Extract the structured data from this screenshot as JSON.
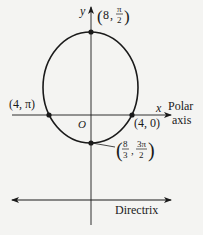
{
  "diagram": {
    "type": "polar-conic-ellipse",
    "axes": {
      "x_label": "x",
      "y_label": "y",
      "origin_label": "O",
      "polar_axis_label_line1": "Polar",
      "polar_axis_label_line2": "axis"
    },
    "points": [
      {
        "name": "top",
        "label_r": "8",
        "label_theta_num": "π",
        "label_theta_den": "2"
      },
      {
        "name": "left",
        "label": "(4, π)"
      },
      {
        "name": "right",
        "label": "(4, 0)"
      },
      {
        "name": "bottom",
        "label_r_num": "8",
        "label_r_den": "3",
        "label_theta_num": "3π",
        "label_theta_den": "2"
      }
    ],
    "directrix_label": "Directrix",
    "colors": {
      "stroke": "#1a1a1a",
      "background": "#f4f4f2"
    }
  }
}
